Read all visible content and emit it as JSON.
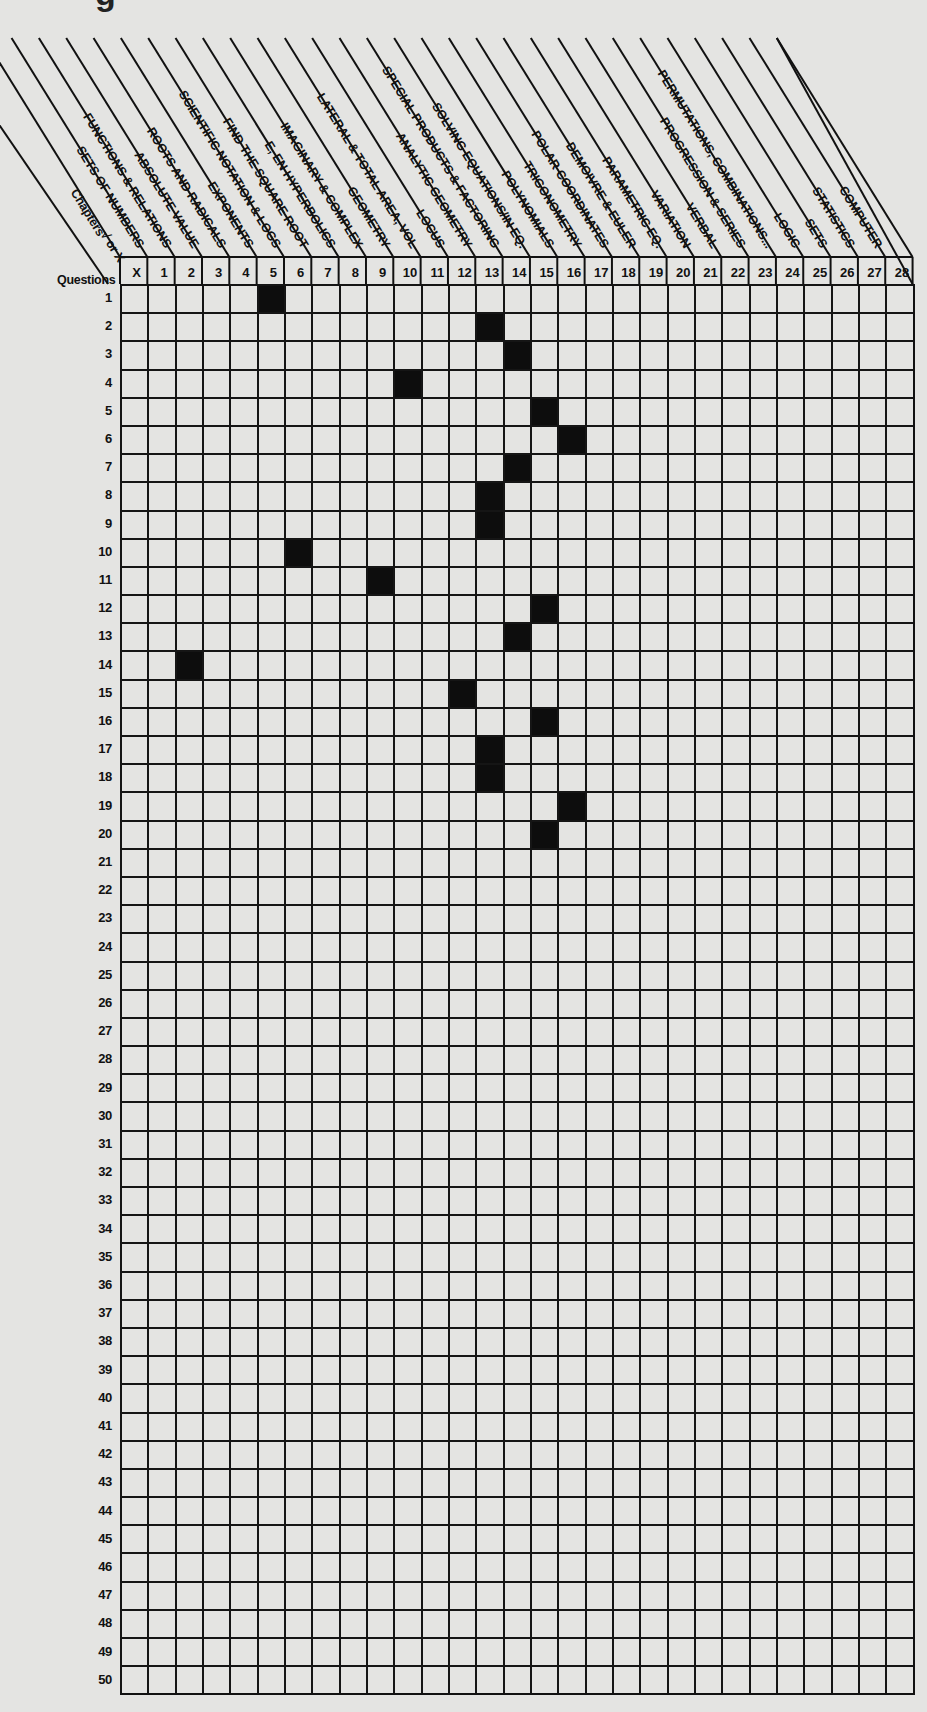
{
  "title_fragment": "g",
  "header": {
    "chapters_label": "Chapters",
    "mark_label": "√ or X",
    "questions_label": "Questions"
  },
  "columns": [
    {
      "number": "X",
      "label": ""
    },
    {
      "number": "1",
      "label": "SETS OF NUMBERS"
    },
    {
      "number": "2",
      "label": "FUNCTIONS & RELATIONS"
    },
    {
      "number": "3",
      "label": "ABSOLUTE VALUE"
    },
    {
      "number": "4",
      "label": "ROOTS AND RADICALS"
    },
    {
      "number": "5",
      "label": "EXPONENTS"
    },
    {
      "number": "6",
      "label": "SCIENTIFIC NOTATION & LOGS"
    },
    {
      "number": "7",
      "label": "FIND THE SQUARE ROOT"
    },
    {
      "number": "8",
      "label": "E, EN HYPERBOLICS"
    },
    {
      "number": "9",
      "label": "IMAGINARY & COMPLEX"
    },
    {
      "number": "10",
      "label": "GEOMETRY"
    },
    {
      "number": "11",
      "label": "LATERAL & TOTAL AREA, VOL"
    },
    {
      "number": "12",
      "label": "LOCUS"
    },
    {
      "number": "13",
      "label": "ANALYTIC GEOMETRY"
    },
    {
      "number": "14",
      "label": "SPECIAL PRODUCTS & FACTORING"
    },
    {
      "number": "15",
      "label": "SOLVING EQUATIONS/IN EQ."
    },
    {
      "number": "16",
      "label": "POLYNOMIALS"
    },
    {
      "number": "17",
      "label": "TRIGONOMETRY"
    },
    {
      "number": "18",
      "label": "POLAR COORDINATES"
    },
    {
      "number": "19",
      "label": "DEMOIVRE & EULER"
    },
    {
      "number": "20",
      "label": "PARAMETRIC EQ."
    },
    {
      "number": "21",
      "label": "VARIATION"
    },
    {
      "number": "22",
      "label": "VERBAL"
    },
    {
      "number": "23",
      "label": "PROGRESSION & SERIES"
    },
    {
      "number": "24",
      "label": "PERMUTATIONS, COMBINATIONS..."
    },
    {
      "number": "25",
      "label": "LOGIC"
    },
    {
      "number": "26",
      "label": "SETS"
    },
    {
      "number": "27",
      "label": "STATISTICS"
    },
    {
      "number": "28",
      "label": "COMPUTER"
    }
  ],
  "rows": [
    "1",
    "2",
    "3",
    "4",
    "5",
    "6",
    "7",
    "8",
    "9",
    "10",
    "11",
    "12",
    "13",
    "14",
    "15",
    "16",
    "17",
    "18",
    "19",
    "20",
    "21",
    "22",
    "23",
    "24",
    "25",
    "26",
    "27",
    "28",
    "29",
    "30",
    "31",
    "32",
    "33",
    "34",
    "35",
    "36",
    "37",
    "38",
    "39",
    "40",
    "41",
    "42",
    "43",
    "44",
    "45",
    "46",
    "47",
    "48",
    "49",
    "50"
  ],
  "marked_cells": [
    {
      "question": 1,
      "column": 5
    },
    {
      "question": 2,
      "column": 13
    },
    {
      "question": 3,
      "column": 14
    },
    {
      "question": 4,
      "column": 10
    },
    {
      "question": 5,
      "column": 15
    },
    {
      "question": 6,
      "column": 16
    },
    {
      "question": 7,
      "column": 14
    },
    {
      "question": 8,
      "column": 13
    },
    {
      "question": 9,
      "column": 13
    },
    {
      "question": 10,
      "column": 6
    },
    {
      "question": 11,
      "column": 9
    },
    {
      "question": 12,
      "column": 15
    },
    {
      "question": 13,
      "column": 14
    },
    {
      "question": 14,
      "column": 2
    },
    {
      "question": 15,
      "column": 12
    },
    {
      "question": 16,
      "column": 15
    },
    {
      "question": 17,
      "column": 13
    },
    {
      "question": 18,
      "column": 13
    },
    {
      "question": 19,
      "column": 16
    },
    {
      "question": 20,
      "column": 15
    }
  ],
  "colors": {
    "ink": "#111111",
    "paper": "#e4e4e2",
    "fill": "#0d0d0d"
  }
}
